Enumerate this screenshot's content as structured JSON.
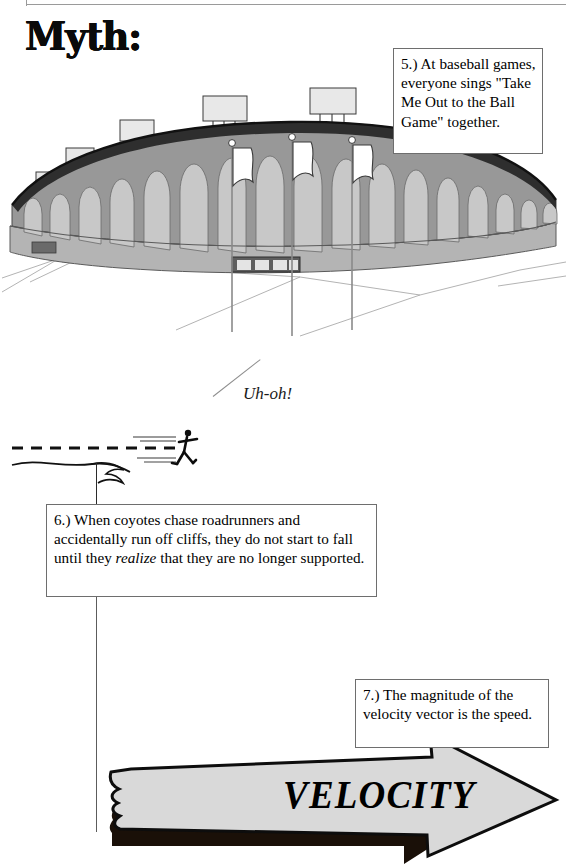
{
  "page": {
    "title": "Myth:",
    "width": 568,
    "height": 864,
    "background": "#ffffff"
  },
  "colors": {
    "ink": "#000000",
    "rule": "#9a9a9a",
    "box_border": "#6e6e6e",
    "stadium_wall": "#989898",
    "stadium_arch": "#c8c8c8",
    "stadium_roof": "#2e2e2e",
    "stadium_base": "#b4b4b4",
    "arrow_fill": "#d9d9d9",
    "arrow_shadow": "#1a1008"
  },
  "callouts": [
    {
      "id": "box5",
      "name": "callout-box-5",
      "number": "5.)",
      "text": "5.)  At baseball games, everyone sings \"Take Me Out to the Ball Game\" together."
    },
    {
      "id": "box6",
      "name": "callout-box-6",
      "number": "6.)",
      "text_before": "6.)  When coyotes chase roadrunners and accidentally run off cliffs, they do not start to fall until they ",
      "emphasis": "realize",
      "text_after": " that they are no longer supported."
    },
    {
      "id": "box7",
      "name": "callout-box-7",
      "number": "7.)",
      "text": "7.)  The magnitude of the velocity vector is the speed."
    }
  ],
  "annotations": {
    "uh_oh": "Uh-oh!",
    "velocity_label": "VELOCITY"
  },
  "illustrations": {
    "stadium": {
      "name": "baseball-stadium-illustration",
      "light_towers": 6,
      "flagpoles": 3,
      "arch_count": 17,
      "entrance_doors": 4
    },
    "cliff_scene": {
      "name": "coyote-cliff-illustration",
      "figure": "running-stick-figure",
      "dashed_trajectory": true,
      "motion_lines": 4
    },
    "velocity_arrow": {
      "name": "velocity-arrow-banner",
      "direction": "right",
      "style": "3d-banner-with-shadow",
      "torn_left_edge": true
    }
  }
}
